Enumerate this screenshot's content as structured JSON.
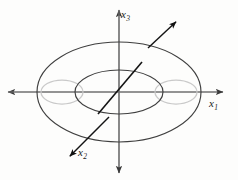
{
  "figure": {
    "kind": "torus-with-axes",
    "width": 238,
    "height": 180,
    "background_color": "#fdfdfc"
  },
  "colors": {
    "outline_dark": "#3a3a3a",
    "outline_light": "#c9c9c9",
    "axis": "#707070",
    "vector": "#111111",
    "label": "#1b1b1b"
  },
  "axes": [
    {
      "id": "x1",
      "name": "x",
      "subscript": "1",
      "orientation": "horizontal",
      "arrowheads": "both",
      "label_x": 209,
      "label_y": 98
    },
    {
      "id": "x3",
      "name": "x",
      "subscript": "3",
      "orientation": "vertical",
      "arrowheads": "both",
      "label_x": 121,
      "label_y": 9
    },
    {
      "id": "x2",
      "name": "x",
      "subscript": "2",
      "orientation": "diagonal-down-left",
      "arrowheads": "single",
      "label_x": 78,
      "label_y": 147
    }
  ],
  "shapes": {
    "outer_ellipse": {
      "cx": 119,
      "cy": 92,
      "rx": 82,
      "ry": 50
    },
    "inner_ellipse": {
      "cx": 119,
      "cy": 92,
      "rx": 44,
      "ry": 22
    },
    "tube_left_ellipse": {
      "cx": 62,
      "cy": 92,
      "rx": 21,
      "ry": 12
    },
    "tube_right_ellipse": {
      "cx": 176,
      "cy": 92,
      "rx": 21,
      "ry": 12
    }
  },
  "vectors": {
    "normal": {
      "x1": 148,
      "y1": 48,
      "x2": 179,
      "y2": 19
    },
    "x2_axis": {
      "x1": 109,
      "y1": 117,
      "x2": 67,
      "y2": 159
    },
    "center_diagonal": {
      "x1": 98,
      "y1": 114,
      "x2": 142,
      "y2": 62
    }
  },
  "axis_extents": {
    "x1": {
      "x1": 8,
      "x2": 223,
      "y": 92
    },
    "x3": {
      "y1": 10,
      "y2": 173,
      "x": 119
    }
  }
}
